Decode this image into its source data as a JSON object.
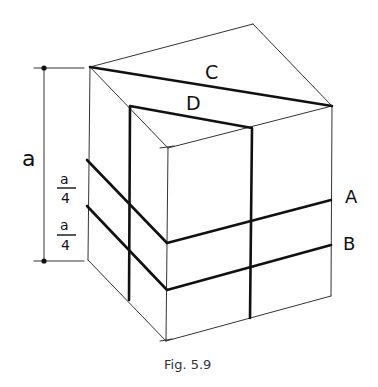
{
  "figure": {
    "caption": "Fig. 5.9",
    "dimension_label": "a",
    "quarter_labels": [
      {
        "numerator": "a",
        "denominator": "4"
      },
      {
        "numerator": "a",
        "denominator": "4"
      }
    ],
    "line_labels": {
      "C": "C",
      "D": "D",
      "A": "A",
      "B": "B"
    }
  }
}
